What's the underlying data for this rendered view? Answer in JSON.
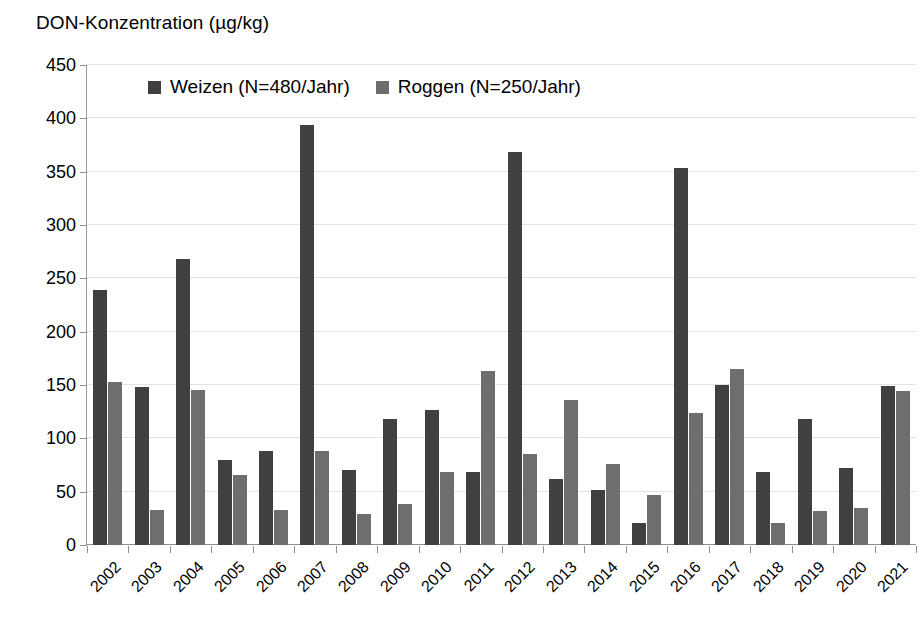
{
  "chart_data": {
    "type": "bar",
    "title": "DON-Konzentration (µg/kg)",
    "xlabel": "",
    "ylabel": "",
    "ylim": [
      0,
      450
    ],
    "ytick_step": 50,
    "yticks": [
      450,
      400,
      350,
      300,
      250,
      200,
      150,
      100,
      50,
      0
    ],
    "grid": true,
    "legend_position": "top-inside-left",
    "categories": [
      "2002",
      "2003",
      "2004",
      "2005",
      "2006",
      "2007",
      "2008",
      "2009",
      "2010",
      "2011",
      "2012",
      "2013",
      "2014",
      "2015",
      "2016",
      "2017",
      "2018",
      "2019",
      "2020",
      "2021"
    ],
    "series": [
      {
        "name": "Weizen (N=480/Jahr)",
        "color": "#404040",
        "values": [
          239,
          148,
          268,
          80,
          88,
          394,
          70,
          118,
          127,
          68,
          368,
          62,
          52,
          21,
          353,
          150,
          68,
          118,
          72,
          149
        ]
      },
      {
        "name": "Roggen (N=250/Jahr)",
        "color": "#6e6e6e",
        "values": [
          153,
          33,
          145,
          66,
          33,
          88,
          29,
          38,
          68,
          163,
          85,
          136,
          76,
          47,
          124,
          165,
          21,
          32,
          35,
          144
        ]
      }
    ]
  },
  "colors": {
    "series_weizen": "#404040",
    "series_roggen": "#6e6e6e",
    "gridline": "#e2e2e2",
    "axis": "#8f8f8f",
    "text": "#000000",
    "background": "#ffffff"
  }
}
